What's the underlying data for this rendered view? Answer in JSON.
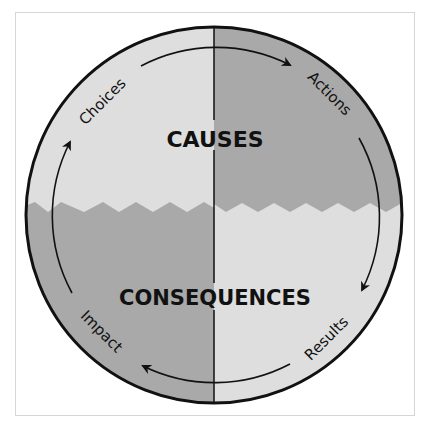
{
  "diagram": {
    "title_top": "CAUSES",
    "title_bottom": "CONSEQUENCES",
    "cycle_labels": {
      "top_left": "Choices",
      "top_right": "Actions",
      "bottom_right": "Results",
      "bottom_left": "Impact"
    },
    "cycle_direction": "clockwise",
    "colors": {
      "light": "#dedede",
      "dark": "#a9a9a9",
      "stroke": "#111111",
      "frame": "#d6d6d6"
    }
  }
}
